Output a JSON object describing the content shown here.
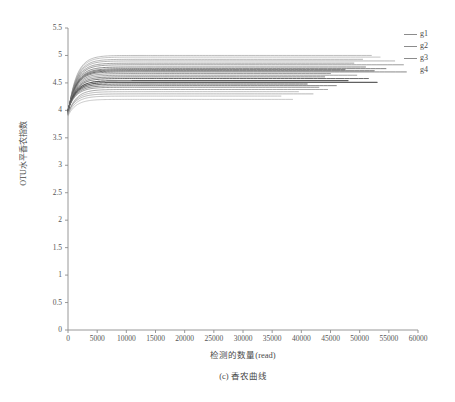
{
  "chart_data": {
    "type": "line",
    "title": "",
    "caption": "(c) 香农曲线",
    "xlabel": "检测的数量(read)",
    "ylabel": "OTU水平香农指数",
    "xlim": [
      0,
      60000
    ],
    "ylim": [
      0,
      5.5
    ],
    "grid": false,
    "legend_position": "right",
    "xticks": [
      0,
      5000,
      10000,
      15000,
      20000,
      25000,
      30000,
      35000,
      40000,
      45000,
      50000,
      55000,
      60000
    ],
    "xtick_labels": [
      "0",
      "5000",
      "10000",
      "15000",
      "20000",
      "25000",
      "30000",
      "35000",
      "40000",
      "45000",
      "50000",
      "55000",
      "60000"
    ],
    "yticks": [
      0,
      0.5,
      1,
      1.5,
      2,
      2.5,
      3,
      3.5,
      4,
      4.5,
      5,
      5.5
    ],
    "ytick_labels": [
      "0",
      "0.5",
      "1",
      "1.5",
      "2",
      "2.5",
      "3",
      "3.5",
      "4",
      "4.5",
      "5",
      "5.5"
    ],
    "legend": [
      {
        "name": "g1",
        "color": "#8c8c8c"
      },
      {
        "name": "g2",
        "color": "#8c8c8c"
      },
      {
        "name": "g3",
        "color": "#8c8c8c"
      },
      {
        "name": "g4",
        "color": "#8c8c8c"
      }
    ],
    "note": "Shannon rarefaction curves: each sample curve rises steeply from ~3.9 at 0 reads, saturating by ~3000 reads, then plateaus flat to its own maximum read depth.",
    "series": [
      {
        "name": "g1-s1",
        "group": "g1",
        "color": "#9a9a9a",
        "start": 3.92,
        "plateau": 5.0,
        "xmax": 52000,
        "width": 0.7
      },
      {
        "name": "g1-s2",
        "group": "g1",
        "color": "#a4a4a4",
        "start": 3.92,
        "plateau": 4.97,
        "xmax": 53500,
        "width": 0.7
      },
      {
        "name": "g1-s3",
        "group": "g1",
        "color": "#8e8e8e",
        "start": 3.93,
        "plateau": 4.93,
        "xmax": 50500,
        "width": 0.7
      },
      {
        "name": "g1-s4",
        "group": "g1",
        "color": "#8a8a8a",
        "start": 3.94,
        "plateau": 4.9,
        "xmax": 56000,
        "width": 0.7
      },
      {
        "name": "g1-s5",
        "group": "g1",
        "color": "#7e7e7e",
        "start": 3.95,
        "plateau": 4.86,
        "xmax": 49000,
        "width": 0.8
      },
      {
        "name": "g2-s1",
        "group": "g2",
        "color": "#787878",
        "start": 3.95,
        "plateau": 4.83,
        "xmax": 57500,
        "width": 0.8
      },
      {
        "name": "g2-s2",
        "group": "g2",
        "color": "#6f6f6f",
        "start": 3.96,
        "plateau": 4.79,
        "xmax": 51000,
        "width": 0.9
      },
      {
        "name": "g2-s3",
        "group": "g2",
        "color": "#6a6a6a",
        "start": 3.96,
        "plateau": 4.76,
        "xmax": 54500,
        "width": 0.9
      },
      {
        "name": "g2-s4",
        "group": "g2",
        "color": "#606060",
        "start": 3.97,
        "plateau": 4.74,
        "xmax": 47500,
        "width": 1.0
      },
      {
        "name": "g2-s5",
        "group": "g2",
        "color": "#5a5a5a",
        "start": 3.97,
        "plateau": 4.72,
        "xmax": 52500,
        "width": 1.0
      },
      {
        "name": "g3-s1",
        "group": "g3",
        "color": "#6d6d6d",
        "start": 3.98,
        "plateau": 4.7,
        "xmax": 58000,
        "width": 0.9
      },
      {
        "name": "g3-s2",
        "group": "g3",
        "color": "#757575",
        "start": 3.98,
        "plateau": 4.67,
        "xmax": 45000,
        "width": 0.8
      },
      {
        "name": "g3-s3",
        "group": "g3",
        "color": "#828282",
        "start": 3.99,
        "plateau": 4.64,
        "xmax": 49500,
        "width": 0.8
      },
      {
        "name": "g3-s4",
        "group": "g3",
        "color": "#6b6b6b",
        "start": 3.99,
        "plateau": 4.61,
        "xmax": 44000,
        "width": 0.9
      },
      {
        "name": "g3-s5",
        "group": "g3",
        "color": "#5f5f5f",
        "start": 4.0,
        "plateau": 4.58,
        "xmax": 51500,
        "width": 1.0
      },
      {
        "name": "g4-s1",
        "group": "g4",
        "color": "#4f4f4f",
        "start": 4.0,
        "plateau": 4.54,
        "xmax": 48000,
        "width": 1.2
      },
      {
        "name": "g4-s2",
        "group": "g4",
        "color": "#545454",
        "start": 4.0,
        "plateau": 4.51,
        "xmax": 53000,
        "width": 1.1
      },
      {
        "name": "g4-s3",
        "group": "g4",
        "color": "#5c5c5c",
        "start": 4.01,
        "plateau": 4.48,
        "xmax": 41000,
        "width": 1.0
      },
      {
        "name": "g4-s4",
        "group": "g4",
        "color": "#6a6a6a",
        "start": 4.01,
        "plateau": 4.45,
        "xmax": 46000,
        "width": 0.9
      },
      {
        "name": "g4-s5",
        "group": "g4",
        "color": "#747474",
        "start": 4.01,
        "plateau": 4.42,
        "xmax": 43000,
        "width": 0.8
      },
      {
        "name": "x-s1",
        "group": "g1",
        "color": "#8a8a8a",
        "start": 3.93,
        "plateau": 4.38,
        "xmax": 44500,
        "width": 0.8
      },
      {
        "name": "x-s2",
        "group": "g2",
        "color": "#9b9b9b",
        "start": 3.94,
        "plateau": 4.34,
        "xmax": 39500,
        "width": 0.7
      },
      {
        "name": "x-s3",
        "group": "g3",
        "color": "#8f8f8f",
        "start": 3.95,
        "plateau": 4.3,
        "xmax": 42000,
        "width": 0.7
      },
      {
        "name": "x-s4",
        "group": "g4",
        "color": "#a2a2a2",
        "start": 3.92,
        "plateau": 4.26,
        "xmax": 36500,
        "width": 0.7
      },
      {
        "name": "x-s5",
        "group": "g1",
        "color": "#ababab",
        "start": 3.9,
        "plateau": 4.2,
        "xmax": 38500,
        "width": 0.7
      }
    ]
  }
}
